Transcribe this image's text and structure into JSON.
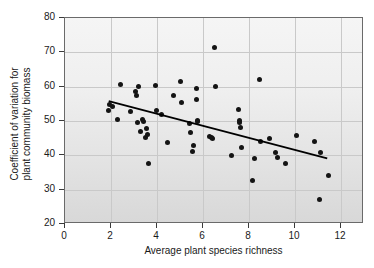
{
  "chart_data": {
    "type": "scatter",
    "title": "",
    "xlabel": "Average plant species richness",
    "ylabel_line1": "Coefficient of variation for",
    "ylabel_line2": "plant community biomass",
    "xlim": [
      0,
      13
    ],
    "ylim": [
      20,
      80
    ],
    "xticks": [
      0,
      2,
      4,
      6,
      8,
      10,
      12
    ],
    "yticks": [
      20,
      30,
      40,
      50,
      60,
      70,
      80
    ],
    "grid": true,
    "legend": "none",
    "marker_color": "#141414",
    "line_color": "#000000",
    "plot_background": "#eaeaea",
    "points": [
      [
        1.9,
        53.0
      ],
      [
        1.95,
        54.8
      ],
      [
        2.05,
        54.3
      ],
      [
        2.3,
        50.4
      ],
      [
        2.4,
        60.5
      ],
      [
        2.85,
        52.8
      ],
      [
        3.05,
        58.6
      ],
      [
        3.1,
        57.4
      ],
      [
        3.15,
        49.6
      ],
      [
        3.2,
        60.1
      ],
      [
        3.3,
        46.9
      ],
      [
        3.35,
        50.4
      ],
      [
        3.4,
        50.0
      ],
      [
        3.5,
        45.1
      ],
      [
        3.55,
        47.8
      ],
      [
        3.6,
        46.2
      ],
      [
        3.62,
        37.7
      ],
      [
        3.95,
        60.4
      ],
      [
        3.98,
        53.1
      ],
      [
        4.2,
        51.9
      ],
      [
        4.45,
        43.8
      ],
      [
        4.7,
        57.5
      ],
      [
        5.0,
        61.4
      ],
      [
        5.05,
        55.5
      ],
      [
        5.4,
        49.4
      ],
      [
        5.45,
        46.7
      ],
      [
        5.55,
        41.2
      ],
      [
        5.6,
        43.0
      ],
      [
        5.7,
        59.5
      ],
      [
        5.72,
        56.4
      ],
      [
        5.75,
        50.3
      ],
      [
        5.78,
        49.9
      ],
      [
        6.3,
        45.6
      ],
      [
        6.35,
        45.2
      ],
      [
        6.4,
        44.8
      ],
      [
        6.5,
        71.5
      ],
      [
        6.55,
        60.2
      ],
      [
        7.25,
        40.0
      ],
      [
        7.55,
        53.4
      ],
      [
        7.58,
        50.1
      ],
      [
        7.6,
        49.6
      ],
      [
        7.62,
        48.1
      ],
      [
        7.65,
        42.3
      ],
      [
        8.15,
        32.7
      ],
      [
        8.25,
        39.0
      ],
      [
        8.45,
        62.1
      ],
      [
        8.5,
        43.9
      ],
      [
        8.9,
        44.9
      ],
      [
        9.15,
        40.8
      ],
      [
        9.25,
        39.4
      ],
      [
        9.6,
        37.7
      ],
      [
        10.05,
        45.9
      ],
      [
        10.85,
        43.9
      ],
      [
        11.05,
        27.2
      ],
      [
        11.1,
        40.7
      ],
      [
        11.45,
        34.1
      ]
    ],
    "trend_line": {
      "x_start": 1.9,
      "y_start": 55.8,
      "x_end": 11.4,
      "y_end": 39.1
    }
  }
}
